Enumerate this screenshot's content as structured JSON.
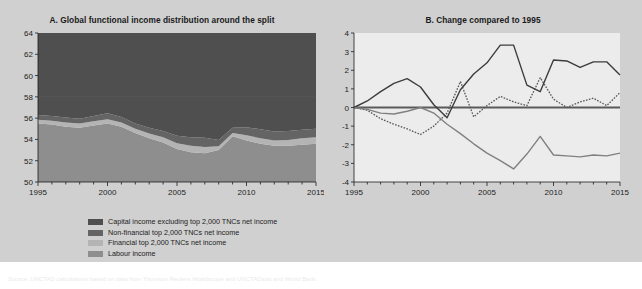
{
  "figure": {
    "background_color": "#d0d0d0",
    "plot_background_color": "#ececec"
  },
  "panel_a": {
    "title": "A. Global functional income distribution around the split",
    "legend": [
      {
        "label": "Capital income excluding top 2,000 TNCs net income",
        "color": "#4f4f4f",
        "swatch": "area"
      },
      {
        "label": "Non-financial top 2,000 TNCs net income",
        "color": "#646464",
        "swatch": "area"
      },
      {
        "label": "Financial top 2,000 TNCs net income",
        "color": "#b4b4b4",
        "swatch": "area"
      },
      {
        "label": "Labour income",
        "color": "#8e8e8e",
        "swatch": "area"
      }
    ]
  },
  "panel_b": {
    "title": "B. Change compared to 1995",
    "legend": [
      {
        "label": "1995 benchmark",
        "color": "#5a5a5a",
        "swatch": "solid"
      },
      {
        "label": "Capital income excluding top 2,000 TNCs net income",
        "color": "#555555",
        "swatch": "dotted"
      },
      {
        "label": "Top 2,000 TNCs net income",
        "color": "#3c3c3c",
        "swatch": "solid"
      },
      {
        "label": "Labour income",
        "color": "#808080",
        "swatch": "solid"
      }
    ]
  },
  "source_note": "Source: UNCTAD calculations based on data from Thomson Reuters Worldscope and UNCTADstat and World Bank.",
  "chart_data": [
    {
      "type": "area",
      "id": "panel-a",
      "title": "A. Global functional income distribution around the split",
      "subtitle": "",
      "xlabel": "",
      "ylabel": "",
      "stacked": true,
      "grid": false,
      "legend_position": "bottom",
      "xlim": [
        1995,
        2015
      ],
      "ylim": [
        50,
        64
      ],
      "ytick_labels": [
        "50",
        "52",
        "54",
        "56",
        "58",
        "60",
        "62",
        "64"
      ],
      "yticks": [
        50,
        52,
        54,
        56,
        58,
        60,
        62,
        64
      ],
      "xtick_labels": [
        "1995",
        "2000",
        "2005",
        "2010",
        "2015"
      ],
      "xticks": [
        1995,
        2000,
        2005,
        2010,
        2015
      ],
      "x": [
        1995,
        1996,
        1997,
        1998,
        1999,
        2000,
        2001,
        2002,
        2003,
        2004,
        2005,
        2006,
        2007,
        2008,
        2009,
        2010,
        2011,
        2012,
        2013,
        2014,
        2015
      ],
      "series": [
        {
          "name": "Labour income",
          "color": "#8e8e8e",
          "note": "bottom band; top edge of this band (cumulative) in percent",
          "values": [
            55.5,
            55.4,
            55.2,
            55.1,
            55.3,
            55.5,
            55.2,
            54.6,
            54.1,
            53.7,
            53.1,
            52.8,
            52.7,
            53.0,
            54.3,
            53.9,
            53.6,
            53.4,
            53.4,
            53.5,
            53.6
          ]
        },
        {
          "name": "Financial top 2,000 TNCs net income",
          "color": "#b4b4b4",
          "note": "band thickness in percentage points",
          "values": [
            0.35,
            0.35,
            0.4,
            0.4,
            0.4,
            0.4,
            0.4,
            0.4,
            0.45,
            0.5,
            0.55,
            0.6,
            0.6,
            0.35,
            0.3,
            0.5,
            0.5,
            0.5,
            0.55,
            0.6,
            0.6
          ]
        },
        {
          "name": "Non-financial top 2,000 TNCs net income",
          "color": "#646464",
          "note": "band thickness in percentage points",
          "values": [
            0.45,
            0.45,
            0.45,
            0.45,
            0.5,
            0.55,
            0.5,
            0.5,
            0.55,
            0.6,
            0.7,
            0.8,
            0.85,
            0.6,
            0.5,
            0.75,
            0.85,
            0.85,
            0.85,
            0.8,
            0.8
          ]
        },
        {
          "name": "Capital income excluding top 2,000 TNCs net income",
          "color": "#4f4f4f",
          "note": "top band, fills remainder to 100 (chart clipped at 64)",
          "values": [
            7.7,
            7.8,
            8.0,
            8.05,
            7.8,
            7.55,
            7.9,
            8.5,
            8.9,
            9.2,
            9.65,
            9.8,
            9.85,
            10.05,
            8.9,
            8.85,
            9.05,
            9.25,
            9.2,
            9.1,
            9.0
          ]
        }
      ]
    },
    {
      "type": "line",
      "id": "panel-b",
      "title": "B. Change compared to 1995",
      "subtitle": "",
      "xlabel": "",
      "ylabel": "",
      "grid": false,
      "legend_position": "bottom",
      "xlim": [
        1995,
        2015
      ],
      "ylim": [
        -4,
        4
      ],
      "ytick_labels": [
        "-4",
        "-3",
        "-2",
        "-1",
        "0",
        "1",
        "2",
        "3",
        "4"
      ],
      "yticks": [
        -4,
        -3,
        -2,
        -1,
        0,
        1,
        2,
        3,
        4
      ],
      "xtick_labels": [
        "1995",
        "2000",
        "2005",
        "2010",
        "2015"
      ],
      "xticks": [
        1995,
        2000,
        2005,
        2010,
        2015
      ],
      "x": [
        1995,
        1996,
        1997,
        1998,
        1999,
        2000,
        2001,
        2002,
        2003,
        2004,
        2005,
        2006,
        2007,
        2008,
        2009,
        2010,
        2011,
        2012,
        2013,
        2014,
        2015
      ],
      "series": [
        {
          "name": "1995 benchmark",
          "color": "#5a5a5a",
          "style": "solid",
          "width": 2.2,
          "values": [
            0,
            0,
            0,
            0,
            0,
            0,
            0,
            0,
            0,
            0,
            0,
            0,
            0,
            0,
            0,
            0,
            0,
            0,
            0,
            0,
            0
          ]
        },
        {
          "name": "Capital income excluding top 2,000 TNCs net income",
          "color": "#555555",
          "style": "dotted",
          "width": 1.3,
          "values": [
            0,
            -0.15,
            -0.6,
            -0.9,
            -1.15,
            -1.45,
            -1.0,
            -0.3,
            1.4,
            -0.5,
            0.1,
            0.6,
            0.3,
            0.1,
            1.6,
            0.45,
            0.0,
            0.3,
            0.5,
            0.1,
            0.8
          ]
        },
        {
          "name": "Top 2,000 TNCs net income",
          "color": "#3c3c3c",
          "style": "solid",
          "width": 1.4,
          "values": [
            0,
            0.35,
            0.85,
            1.3,
            1.55,
            1.1,
            0.15,
            -0.55,
            0.95,
            1.8,
            2.4,
            3.35,
            3.35,
            1.2,
            0.85,
            2.55,
            2.5,
            2.15,
            2.45,
            2.45,
            1.75
          ]
        },
        {
          "name": "Labour income",
          "color": "#808080",
          "style": "solid",
          "width": 1.4,
          "values": [
            0,
            -0.1,
            -0.3,
            -0.35,
            -0.2,
            0.0,
            -0.3,
            -0.9,
            -1.4,
            -1.95,
            -2.45,
            -2.85,
            -3.3,
            -2.5,
            -1.55,
            -2.55,
            -2.6,
            -2.65,
            -2.55,
            -2.6,
            -2.45
          ]
        }
      ]
    }
  ]
}
